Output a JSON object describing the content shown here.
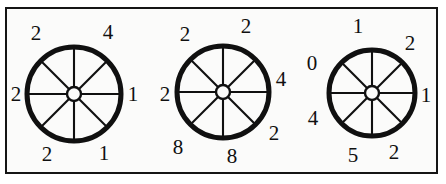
{
  "figure": {
    "background_color": "#ffffff",
    "panel_color": "#fbfbfa",
    "border_color": "#151515",
    "ink_color": "#101010",
    "width": 446,
    "height": 184
  },
  "wheels": [
    {
      "name": "wheel-left",
      "cx": 74,
      "cy": 94,
      "radius": 47,
      "rim_width": 5,
      "hub_radius": 7,
      "spokes": 8,
      "labels": [
        {
          "value": "2",
          "position": "upper-left",
          "x": 36,
          "y": 33
        },
        {
          "value": "4",
          "position": "upper-right",
          "x": 108,
          "y": 32
        },
        {
          "value": "2",
          "position": "left",
          "x": 16,
          "y": 94
        },
        {
          "value": "1",
          "position": "right",
          "x": 133,
          "y": 94
        },
        {
          "value": "2",
          "position": "lower-left",
          "x": 47,
          "y": 154
        },
        {
          "value": "1",
          "position": "lower-right",
          "x": 104,
          "y": 153
        }
      ]
    },
    {
      "name": "wheel-middle",
      "cx": 223,
      "cy": 92,
      "radius": 46,
      "rim_width": 5,
      "hub_radius": 7,
      "spokes": 8,
      "labels": [
        {
          "value": "2",
          "position": "upper-left",
          "x": 185,
          "y": 34
        },
        {
          "value": "2",
          "position": "top-right",
          "x": 246,
          "y": 26
        },
        {
          "value": "2",
          "position": "left",
          "x": 165,
          "y": 94
        },
        {
          "value": "4",
          "position": "right",
          "x": 281,
          "y": 79
        },
        {
          "value": "2",
          "position": "lower-right",
          "x": 274,
          "y": 133
        },
        {
          "value": "8",
          "position": "lower-left",
          "x": 178,
          "y": 147
        },
        {
          "value": "8",
          "position": "bottom",
          "x": 232,
          "y": 156
        }
      ]
    },
    {
      "name": "wheel-right",
      "cx": 372,
      "cy": 93,
      "radius": 43,
      "rim_width": 5,
      "hub_radius": 7,
      "spokes": 8,
      "labels": [
        {
          "value": "1",
          "position": "top",
          "x": 358,
          "y": 26
        },
        {
          "value": "2",
          "position": "upper-right",
          "x": 410,
          "y": 43
        },
        {
          "value": "0",
          "position": "upper-left",
          "x": 312,
          "y": 63
        },
        {
          "value": "1",
          "position": "right",
          "x": 426,
          "y": 95
        },
        {
          "value": "4",
          "position": "lower-left",
          "x": 313,
          "y": 118
        },
        {
          "value": "5",
          "position": "bottom-left",
          "x": 353,
          "y": 155
        },
        {
          "value": "2",
          "position": "lower-right",
          "x": 394,
          "y": 152
        }
      ]
    }
  ]
}
